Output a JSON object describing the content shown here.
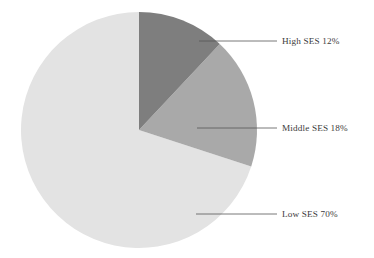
{
  "chart_data": {
    "type": "pie",
    "title": "",
    "subtitle": "",
    "xlabel": "",
    "ylabel": "",
    "legend_position": "none",
    "grid": false,
    "labels_position": "outside-right-with-leader-lines",
    "start_angle_deg": 0,
    "direction": "clockwise",
    "categories": [
      "High SES",
      "Middle SES",
      "Low SES"
    ],
    "values": [
      12,
      18,
      70
    ],
    "units": "percent",
    "colors": [
      "#7e7e7e",
      "#a9a9a9",
      "#e3e3e3"
    ],
    "slices": [
      {
        "name": "High SES",
        "value": 12,
        "value_text": "12%",
        "label": "High SES 12%",
        "color": "#7e7e7e",
        "start_angle_deg": 0,
        "end_angle_deg": 43.2
      },
      {
        "name": "Middle SES",
        "value": 18,
        "value_text": "18%",
        "label": "Middle SES 18%",
        "color": "#a9a9a9",
        "start_angle_deg": 43.2,
        "end_angle_deg": 108.0
      },
      {
        "name": "Low SES",
        "value": 70,
        "value_text": "70%",
        "label": "Low SES 70%",
        "color": "#e3e3e3",
        "start_angle_deg": 108.0,
        "end_angle_deg": 360.0
      }
    ]
  },
  "figure": {
    "background_color": "#ffffff",
    "text_color": "#3c3c3c",
    "leader_line_color": "#555555",
    "pie_center_x": 139,
    "pie_center_y": 130,
    "pie_radius": 118
  },
  "labels": {
    "high": "High SES 12%",
    "middle": "Middle SES 18%",
    "low": "Low SES 70%"
  }
}
